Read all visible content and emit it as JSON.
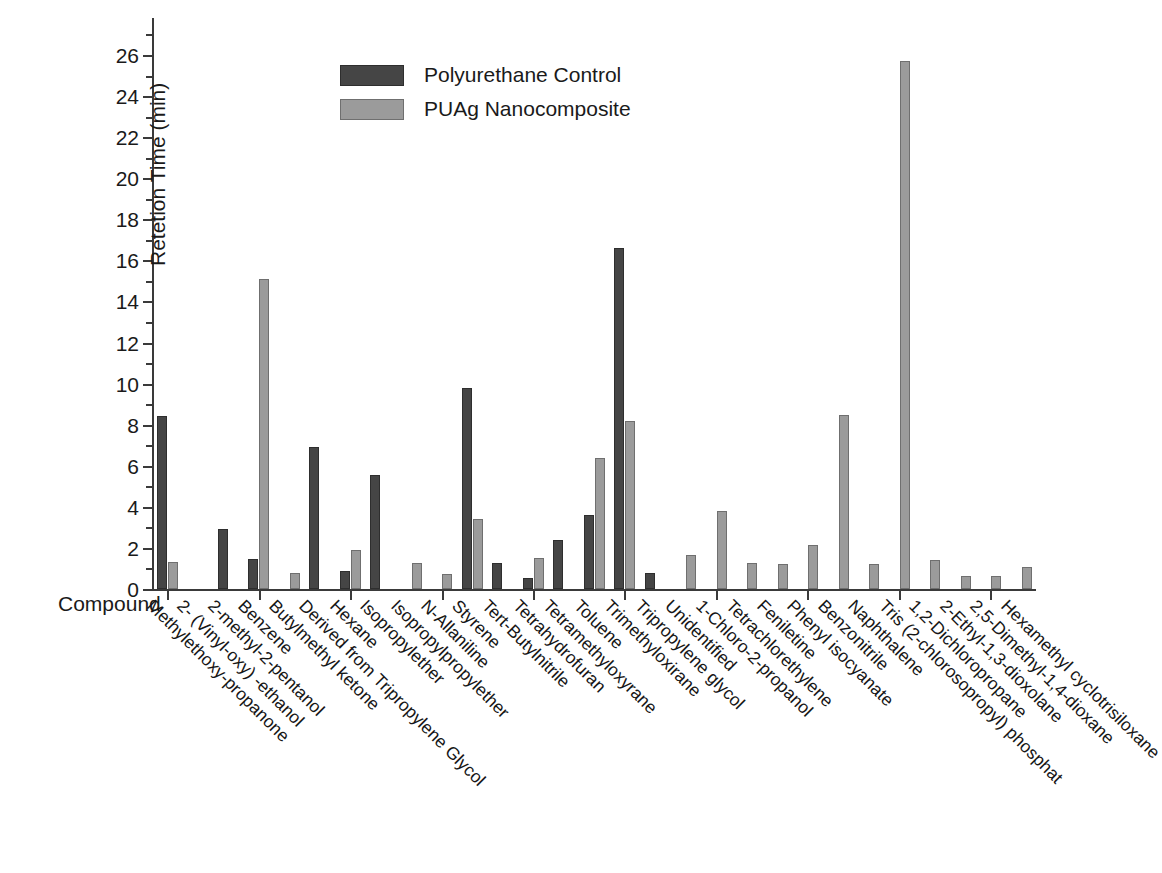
{
  "chart_data": {
    "type": "bar",
    "title": "",
    "xlabel": "Compound",
    "ylabel": "Retetion Time (min)",
    "ylim": [
      0,
      27
    ],
    "ytick_step": 2,
    "yticks": [
      "0",
      "2",
      "4",
      "6",
      "8",
      "10",
      "12",
      "14",
      "16",
      "18",
      "20",
      "22",
      "24",
      "26"
    ],
    "grid": false,
    "legend_position": "top-left",
    "colors": {
      "control": "#454545",
      "nano": "#9b9b9b",
      "axis": "#3a3a3a",
      "background": "#ffffff"
    },
    "categories": [
      "Methylethoxy-propanone",
      "2- (Vinyl-oxy) -ethanol",
      "2-methyl-2-pentanol",
      "Benzene",
      "Butylmethyl ketone",
      "Derived from Tripropylene Glycol",
      "Hexane",
      "Isopropylether",
      "Isopropylpropylether",
      "N-Allaniline",
      "Styrene",
      "Tert-Butylnitrile",
      "Tetrahydrofuran",
      "Tetramethyloxyrane",
      "Toluene",
      "Trimethyloxirane",
      "Tripropylene glycol",
      "Unidentified",
      "1-Chloro-2-propanol",
      "Tetrachlorethylene",
      "Feniletine",
      "Phenyl isocyanate",
      "Benzonitrile",
      "Naphthalene",
      "Tris (2-chlorosopropyl) phosphat",
      "1,2-Dichloropropane",
      "2-Ethyl-1,3-dioxolane",
      "2,5-Dimethyl-1,4-dioxane",
      "Hexamethyl cyclotrisiloxane"
    ],
    "series": [
      {
        "name": "Polyurethane Control",
        "key": "control",
        "values": [
          8.4,
          0,
          2.9,
          1.45,
          0,
          6.9,
          0.9,
          5.55,
          0,
          0,
          9.8,
          1.25,
          0.55,
          2.4,
          3.6,
          16.6,
          0.8,
          0,
          0,
          0,
          0,
          0,
          0,
          0,
          0,
          0,
          0,
          0,
          0
        ]
      },
      {
        "name": "PUAg Nanocomposite",
        "key": "nano",
        "values": [
          1.3,
          0,
          0,
          15.1,
          0.8,
          0,
          1.9,
          0,
          1.25,
          0.75,
          3.4,
          0,
          1.5,
          0,
          6.4,
          8.2,
          0,
          1.65,
          3.8,
          1.25,
          1.2,
          2.15,
          8.45,
          1.2,
          25.7,
          1.4,
          0.65,
          0.65,
          1.05
        ]
      }
    ]
  },
  "legend": {
    "items": [
      {
        "label": "Polyurethane Control",
        "key": "control"
      },
      {
        "label": "PUAg Nanocomposite",
        "key": "nano"
      }
    ]
  }
}
